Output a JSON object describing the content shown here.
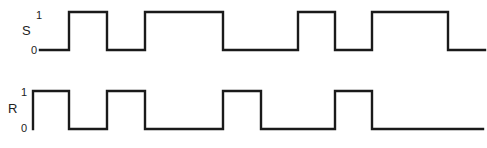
{
  "diagram": {
    "type": "timing-diagram",
    "stroke_color": "#1a1a1a",
    "signals": [
      {
        "name": "S",
        "level_high_label": "1",
        "level_low_label": "0",
        "y_high": 12,
        "y_low": 50,
        "name_pos": [
          22,
          35
        ],
        "high_label_pos": [
          36,
          19
        ],
        "low_label_pos": [
          32,
          54
        ],
        "start_x": 40,
        "end_x": 485,
        "initial_level": 0,
        "transitions_x": [
          69,
          107,
          145,
          223,
          298,
          335,
          372,
          448
        ]
      },
      {
        "name": "R",
        "level_high_label": "1",
        "level_low_label": "0",
        "y_high": 91,
        "y_low": 129,
        "name_pos": [
          8,
          113
        ],
        "high_label_pos": [
          22,
          96
        ],
        "low_label_pos": [
          22,
          132
        ],
        "start_x": 33,
        "end_x": 483,
        "initial_level": 1,
        "start_from_low": true,
        "transitions_x": [
          69,
          107,
          145,
          223,
          261,
          335,
          372
        ]
      }
    ]
  }
}
